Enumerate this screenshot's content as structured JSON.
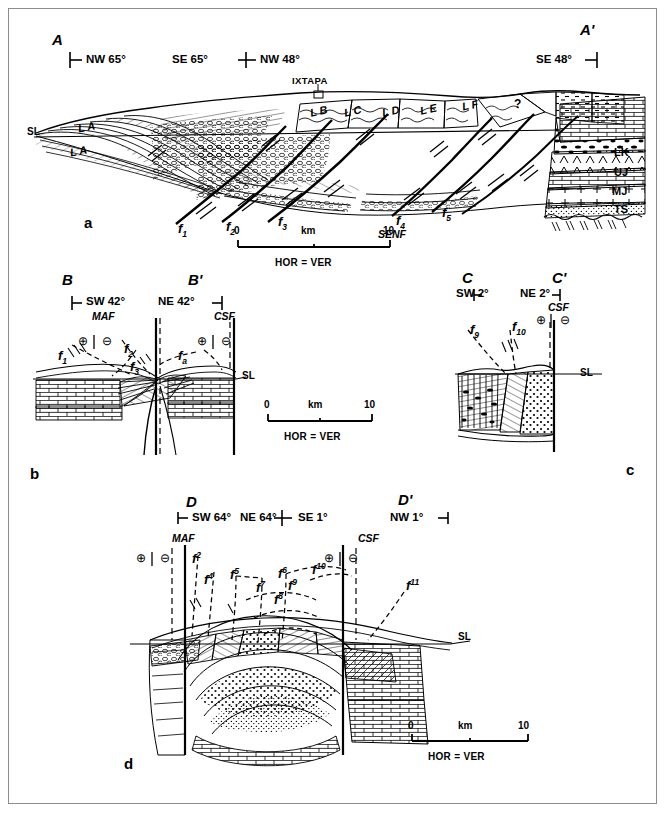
{
  "figure": {
    "type": "geological-cross-sections",
    "panels": [
      "a",
      "b",
      "c",
      "d"
    ],
    "colors": {
      "ink": "#000000",
      "frame": "#8d8d8d",
      "background": "#ffffff"
    }
  },
  "panel_a": {
    "letter": "a",
    "left_end": "A",
    "right_end": "A'",
    "bearings": [
      {
        "text": "NW 65°",
        "tick": "left"
      },
      {
        "text": "SE 65°",
        "tick": "none"
      },
      {
        "text": "NW 48°",
        "tick": "none"
      },
      {
        "text": "SE 48°",
        "tick": "right"
      }
    ],
    "town": "IXTAPA",
    "sea_level": "SL",
    "thrust_sheets": [
      "L A",
      "L A",
      "L B",
      "L C",
      "L D",
      "L E",
      "L F"
    ],
    "query_mark": "?",
    "faults": [
      "f1",
      "f2",
      "f3",
      "f4",
      "f5"
    ],
    "fault_subscripts": [
      "1",
      "2",
      "3",
      "4",
      "5"
    ],
    "fault_zone": "SENF",
    "strat_units": [
      "LK",
      "UJ",
      "MJ",
      "TS"
    ],
    "scale": {
      "min": "0",
      "max": "10",
      "unit": "km",
      "note": "HOR = VER"
    }
  },
  "panel_b": {
    "letter": "b",
    "left_end": "B",
    "right_end": "B'",
    "bearings": [
      {
        "text": "SW 42°",
        "tick": "left"
      },
      {
        "text": "NE 42°",
        "tick": "right"
      }
    ],
    "fault_systems": [
      "MAF",
      "CSF"
    ],
    "polarity": {
      "positive": "⊕",
      "negative": "⊖"
    },
    "faults": [
      "f1",
      "f2",
      "f3",
      "fa"
    ],
    "fault_subscripts": [
      "1",
      "2",
      "3",
      "a"
    ],
    "sea_level": "SL",
    "scale": {
      "min": "0",
      "max": "10",
      "unit": "km",
      "note": "HOR = VER"
    }
  },
  "panel_c": {
    "letter": "c",
    "left_end": "C",
    "right_end": "C'",
    "bearings": [
      {
        "text": "SW 2°",
        "tick": "left"
      },
      {
        "text": "NE 2°",
        "tick": "right"
      }
    ],
    "fault_systems": [
      "CSF"
    ],
    "polarity": {
      "positive": "⊕",
      "negative": "⊖"
    },
    "faults": [
      "f9",
      "f10"
    ],
    "fault_subscripts": [
      "9",
      "10"
    ],
    "sea_level": "SL"
  },
  "panel_d": {
    "letter": "d",
    "left_end": "D",
    "right_end": "D'",
    "bearings": [
      {
        "text": "SW 64°",
        "tick": "left"
      },
      {
        "text": "NE 64°",
        "tick": "none"
      },
      {
        "text": "SE 1°",
        "tick": "none"
      },
      {
        "text": "NW 1°",
        "tick": "right"
      }
    ],
    "fault_systems": [
      "MAF",
      "CSF"
    ],
    "polarity": {
      "positive": "⊕",
      "negative": "⊖"
    },
    "faults": [
      "f2",
      "f4",
      "f5",
      "f6",
      "f7",
      "f8",
      "f9",
      "f10",
      "f11"
    ],
    "fault_superscripts": [
      "2",
      "4",
      "5",
      "6",
      "7",
      "8",
      "9",
      "10",
      "11"
    ],
    "sea_level": "SL",
    "scale": {
      "min": "0",
      "max": "10",
      "unit": "km",
      "note": "HOR = VER"
    }
  }
}
